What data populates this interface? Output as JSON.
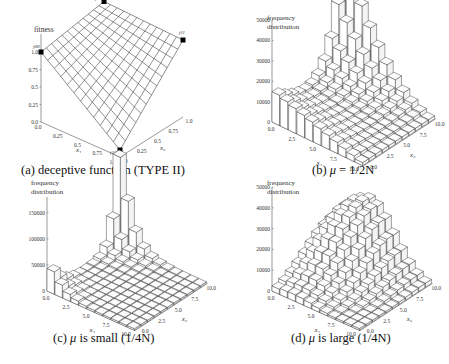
{
  "figure": {
    "panels": [
      {
        "id": "a",
        "caption_prefix": "(a) deceptive function (TYPE II)",
        "caption_mu": "",
        "caption_suffix": "",
        "ylabel_line1": "fitness",
        "ylabel_line2": ""
      },
      {
        "id": "b",
        "caption_prefix": "(b) ",
        "caption_mu": "μ",
        "caption_suffix": " = 1/2N",
        "ylabel_line1": "frequency",
        "ylabel_line2": "distribution"
      },
      {
        "id": "c",
        "caption_prefix": "(c) ",
        "caption_mu": "μ",
        "caption_suffix": " is small (1/4N)",
        "ylabel_line1": "frequency",
        "ylabel_line2": "distribution"
      },
      {
        "id": "d",
        "caption_prefix": "(d) ",
        "caption_mu": "μ",
        "caption_suffix": " is large (1/4N)",
        "ylabel_line1": "frequency",
        "ylabel_line2": "distribution"
      }
    ]
  },
  "chart_data": [
    {
      "id": "a",
      "type": "surface",
      "title": "(a) deceptive function (TYPE II)",
      "zlabel": "fitness",
      "xlabel": "x1",
      "ylabel": "x2",
      "x_ticks": [
        "0.0",
        "0.25",
        "0.5",
        "0.75",
        "1.0"
      ],
      "y_ticks": [
        "0.0",
        "0.25",
        "0.5",
        "0.75",
        "1.0"
      ],
      "z_ticks": [
        "0.0",
        "0.25",
        "0.5",
        "0.75",
        "1.0"
      ],
      "zlim": [
        0,
        1.2
      ],
      "corners": [
        {
          "label": "f00",
          "x1": 0,
          "x2": 0,
          "fitness": 1.0
        },
        {
          "label": "f01",
          "x1": 0,
          "x2": 1,
          "fitness": 1.15
        },
        {
          "label": "f11",
          "x1": 1,
          "x2": 1,
          "fitness": 1.1
        },
        {
          "label": "f10",
          "x1": 1,
          "x2": 0,
          "fitness": 0.1
        }
      ],
      "grid_divisions": 12
    },
    {
      "id": "b",
      "type": "bar3d",
      "title": "(b) μ = 1/2N",
      "zlabel": "frequency distribution",
      "xlabel": "x1",
      "ylabel": "x2",
      "x_ticks": [
        "0.0",
        "2.5",
        "5.0",
        "7.5",
        "10.0"
      ],
      "y_ticks": [
        "0.0",
        "2.5",
        "5.0",
        "7.5",
        "10.0"
      ],
      "z_ticks": [
        "0",
        "10000",
        "20000",
        "30000",
        "40000",
        "50000"
      ],
      "zlim": [
        0,
        50000
      ],
      "description": "Peak near x1=0,x2=10 (~50000), ridge along x1=0 edge rising toward x2=10; ~12000 at x1=0,x2=0; near-zero at x1=10,x2=0",
      "peak": {
        "x1": 0,
        "x2": 10,
        "value": 50000
      },
      "origin_value": 12000
    },
    {
      "id": "c",
      "type": "bar3d",
      "title": "(c) μ is small (1/4N)",
      "zlabel": "frequency distribution",
      "xlabel": "x1",
      "ylabel": "x2",
      "x_ticks": [
        "0.0",
        "2.5",
        "5.0",
        "7.5",
        "10.0"
      ],
      "y_ticks": [
        "0.0",
        "2.5",
        "5.0",
        "7.5",
        "10.0"
      ],
      "z_ticks": [
        "0",
        "50000",
        "100000",
        "150000"
      ],
      "zlim": [
        0,
        180000
      ],
      "description": "Sharp peak at x1=0,x2=10 (~175000), secondary ~40000 at origin, flat elsewhere",
      "peak": {
        "x1": 0,
        "x2": 10,
        "value": 175000
      },
      "origin_value": 40000
    },
    {
      "id": "d",
      "type": "bar3d",
      "title": "(d) μ is large (1/4N)",
      "zlabel": "frequency distribution",
      "xlabel": "x1",
      "ylabel": "x2",
      "x_ticks": [
        "0.0",
        "2.5",
        "5.0",
        "7.5",
        "10.0"
      ],
      "y_ticks": [
        "0.0",
        "2.5",
        "5.0",
        "7.5",
        "10.0"
      ],
      "z_ticks": [
        "0",
        "10000",
        "20000",
        "30000",
        "40000",
        "50000"
      ],
      "zlim": [
        0,
        50000
      ],
      "description": "Broad dome with maximum ~32000 around x1=2.5-5,x2=7.5; low near x1=10,x2=0",
      "peak": {
        "x1": 3,
        "x2": 8,
        "value": 32000
      },
      "origin_value": 2000
    }
  ]
}
